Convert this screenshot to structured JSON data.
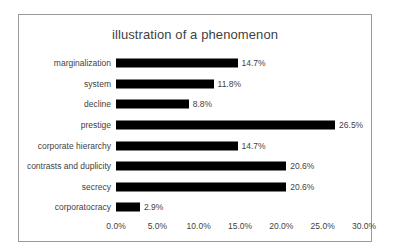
{
  "chart_data": {
    "type": "bar",
    "orientation": "horizontal",
    "title": "illustration of a phenomenon",
    "xlabel": "",
    "ylabel": "",
    "grid": false,
    "legend": false,
    "xlim": [
      0,
      30
    ],
    "categories": [
      "marginalization",
      "system",
      "decline",
      "prestige",
      "corporate hierarchy",
      "contrasts and duplicity",
      "secrecy",
      "corporatocracy"
    ],
    "values": [
      14.7,
      11.8,
      8.8,
      26.5,
      14.7,
      20.6,
      20.6,
      2.9
    ],
    "value_labels": [
      "14.7%",
      "11.8%",
      "8.8%",
      "26.5%",
      "14.7%",
      "20.6%",
      "20.6%",
      "2.9%"
    ],
    "xticks": [
      0,
      5,
      10,
      15,
      20,
      25,
      30
    ],
    "xtick_labels": [
      "0.0%",
      "5.0%",
      "10.0%",
      "15.0%",
      "20.0%",
      "25.0%",
      "30.0%"
    ],
    "bar_color": "#000000",
    "text_color": "#3f3f3f",
    "frame_color": "#9a9a9a",
    "background": "#ffffff"
  }
}
